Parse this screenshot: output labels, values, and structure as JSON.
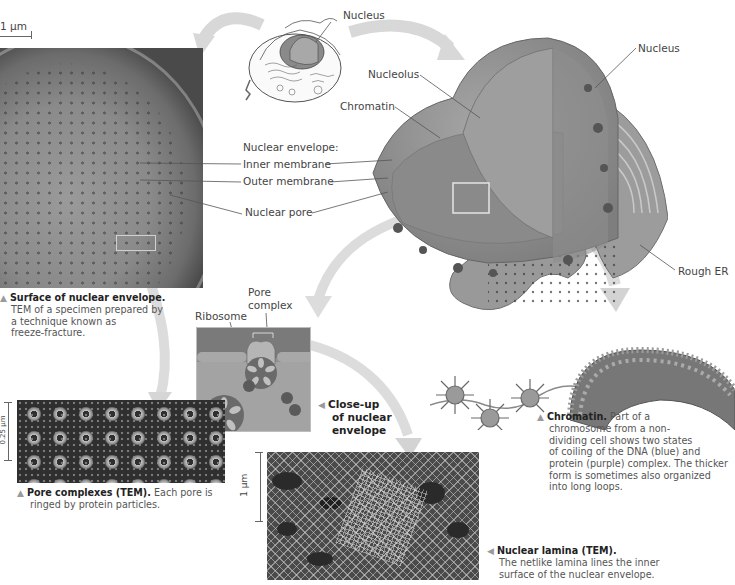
{
  "figure": {
    "title_hint": "Nucleus and its envelope",
    "scale_bars": {
      "surface": "1 µm",
      "pores": "0.25 µm",
      "lamina": "1 µm"
    },
    "cell_sketch": {
      "label": "Nucleus"
    },
    "nucleus_3d": {
      "labels": {
        "nucleus": "Nucleus",
        "nucleolus": "Nucleolus",
        "chromatin": "Chromatin",
        "rough_er": "Rough ER"
      }
    },
    "envelope_labels": {
      "heading": "Nuclear envelope:",
      "inner": "Inner membrane",
      "outer": "Outer membrane",
      "pore": "Nuclear pore"
    },
    "closeup_labels": {
      "pore_complex_line1": "Pore",
      "pore_complex_line2": "complex",
      "ribosome": "Ribosome"
    },
    "captions": {
      "surface": {
        "title": "Surface of nuclear envelope.",
        "line1": "TEM of a specimen prepared by",
        "line2": "a technique known as",
        "line3": "freeze-fracture."
      },
      "closeup": {
        "line1": "Close-up",
        "line2": "of nuclear",
        "line3": "envelope"
      },
      "pores": {
        "title": "Pore complexes (TEM).",
        "line1": "Each pore is",
        "line2": "ringed by protein particles."
      },
      "lamina": {
        "title": "Nuclear lamina (TEM).",
        "line1": "The netlike lamina lines the inner",
        "line2": "surface of the nuclear envelope."
      },
      "chromatin": {
        "title": "Chromatin.",
        "line0": "Part of a",
        "line1": "chromosome from a non-",
        "line2": "dividing cell shows two states",
        "line3": "of coiling of the DNA (blue) and",
        "line4": "protein (purple) complex. The thicker",
        "line5": "form is sometimes also organized",
        "line6": "into long loops."
      }
    },
    "colors": {
      "arrow": "#d6d6d6",
      "nucleus_body": "#8e8e8e",
      "leader_line": "#555555"
    }
  }
}
